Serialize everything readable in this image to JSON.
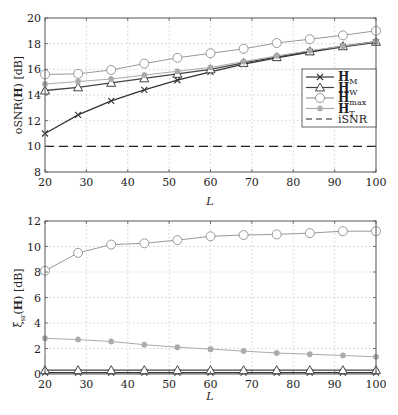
{
  "chart_data": [
    {
      "type": "line",
      "title": "",
      "xlabel": "L",
      "ylabel": "oSNR(H) [dB]",
      "x": [
        20,
        28,
        36,
        44,
        52,
        60,
        68,
        76,
        84,
        92,
        100
      ],
      "xlim": [
        20,
        100
      ],
      "ylim": [
        8,
        20
      ],
      "xticks": [
        20,
        30,
        40,
        50,
        60,
        70,
        80,
        90,
        100
      ],
      "yticks": [
        8,
        10,
        12,
        14,
        16,
        18,
        20
      ],
      "grid": true,
      "legend_position": "right-middle",
      "series": [
        {
          "name": "H_M",
          "marker": "x",
          "color": "#333333",
          "values": [
            11.0,
            12.45,
            13.55,
            14.4,
            15.15,
            15.8,
            16.4,
            16.9,
            17.35,
            17.75,
            18.1
          ]
        },
        {
          "name": "H_W",
          "marker": "triangle",
          "color": "#444444",
          "values": [
            14.35,
            14.6,
            14.95,
            15.3,
            15.65,
            16.0,
            16.5,
            16.95,
            17.4,
            17.8,
            18.15
          ]
        },
        {
          "name": "H_max",
          "marker": "circle",
          "color": "#999999",
          "values": [
            15.6,
            15.65,
            15.95,
            16.45,
            16.9,
            17.25,
            17.6,
            18.05,
            18.35,
            18.65,
            19.0
          ]
        },
        {
          "name": "H_T",
          "marker": "star",
          "color": "#aaaaaa",
          "values": [
            14.85,
            15.05,
            15.25,
            15.55,
            15.85,
            16.15,
            16.6,
            17.05,
            17.45,
            17.8,
            18.15
          ]
        },
        {
          "name": "iSNR",
          "marker": "none",
          "color": "#222222",
          "dashed": true,
          "values": [
            10,
            10,
            10,
            10,
            10,
            10,
            10,
            10,
            10,
            10,
            10
          ]
        }
      ],
      "legend": [
        "H_M",
        "H_W",
        "H_max",
        "H_T",
        "iSNR"
      ]
    },
    {
      "type": "line",
      "title": "",
      "xlabel": "L",
      "ylabel": "ξ_sr(H) [dB]",
      "x": [
        20,
        28,
        36,
        44,
        52,
        60,
        68,
        76,
        84,
        92,
        100
      ],
      "xlim": [
        20,
        100
      ],
      "ylim": [
        0,
        12
      ],
      "xticks": [
        20,
        30,
        40,
        50,
        60,
        70,
        80,
        90,
        100
      ],
      "yticks": [
        0,
        2,
        4,
        6,
        8,
        10,
        12
      ],
      "grid": true,
      "series": [
        {
          "name": "H_M",
          "marker": "x",
          "color": "#333333",
          "values": [
            0.1,
            0.1,
            0.1,
            0.1,
            0.1,
            0.1,
            0.1,
            0.1,
            0.1,
            0.1,
            0.1
          ]
        },
        {
          "name": "H_W",
          "marker": "triangle",
          "color": "#444444",
          "values": [
            0.3,
            0.3,
            0.3,
            0.3,
            0.3,
            0.3,
            0.3,
            0.3,
            0.3,
            0.3,
            0.3
          ]
        },
        {
          "name": "H_max",
          "marker": "circle",
          "color": "#999999",
          "values": [
            8.1,
            9.5,
            10.15,
            10.25,
            10.5,
            10.8,
            10.9,
            10.95,
            11.05,
            11.2,
            11.2
          ]
        },
        {
          "name": "H_T",
          "marker": "star",
          "color": "#aaaaaa",
          "values": [
            2.8,
            2.7,
            2.55,
            2.3,
            2.1,
            1.95,
            1.8,
            1.65,
            1.55,
            1.45,
            1.35
          ]
        }
      ]
    }
  ],
  "top": {
    "ylabel_main": "oSNR(",
    "ylabel_bold": "H",
    "ylabel_end": ") [dB]",
    "xlabel": "L"
  },
  "bottom": {
    "ylabel_xi": "ξ",
    "ylabel_sub": "sr",
    "ylabel_open": "(",
    "ylabel_bold": "H",
    "ylabel_end": ") [dB]",
    "xlabel": "L"
  },
  "legend": {
    "items": [
      {
        "main": "H",
        "sub": "M"
      },
      {
        "main": "H",
        "sub": "W"
      },
      {
        "main": "H",
        "sub": "max"
      },
      {
        "main": "H",
        "sub": "T"
      },
      {
        "main": "iSNR",
        "sub": ""
      }
    ]
  }
}
